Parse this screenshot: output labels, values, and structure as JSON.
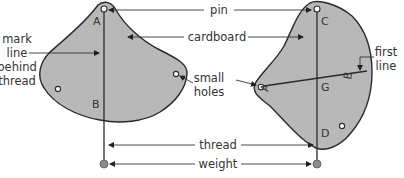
{
  "labels": {
    "pin": "pin",
    "cardboard": "cardboard",
    "mark_line": [
      "mark",
      "line",
      "behind",
      "thread"
    ],
    "small_holes": [
      "small",
      "holes"
    ],
    "first_line": [
      "first",
      "line"
    ],
    "thread": "thread",
    "weight": "weight"
  },
  "points": {
    "left": {
      "A": "A",
      "B": "B"
    },
    "right": {
      "C": "C",
      "G": "G",
      "D": "D",
      "A": "A",
      "B": "B"
    }
  },
  "colors": {
    "cardboard": "#b8b8b8",
    "outline": "#2a2a2a",
    "weight": "#8c8c8c"
  }
}
